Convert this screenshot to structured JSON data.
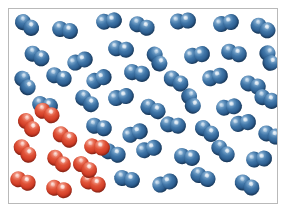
{
  "figure": {
    "width": 288,
    "height": 214
  },
  "frame": {
    "border_color": "#b9b9b9",
    "background_color": "#ffffff",
    "x": 8,
    "y": 8,
    "width": 270,
    "height": 196
  },
  "legend": {
    "blue_label": "blue diatomic molecule",
    "red_label": "red diatomic molecule",
    "blue_color": "#2c5d8f",
    "red_color": "#cf3a24"
  },
  "counts": {
    "blue": 43,
    "red": 10,
    "total": 53
  },
  "molecules": [
    {
      "color": "blue",
      "x": 26,
      "y": 24,
      "rot": 35
    },
    {
      "color": "blue",
      "x": 64,
      "y": 29,
      "rot": 12
    },
    {
      "color": "blue",
      "x": 108,
      "y": 20,
      "rot": -8
    },
    {
      "color": "blue",
      "x": 141,
      "y": 25,
      "rot": 20
    },
    {
      "color": "blue",
      "x": 182,
      "y": 20,
      "rot": -5
    },
    {
      "color": "blue",
      "x": 225,
      "y": 22,
      "rot": -12
    },
    {
      "color": "blue",
      "x": 262,
      "y": 27,
      "rot": 28
    },
    {
      "color": "blue",
      "x": 36,
      "y": 55,
      "rot": 28
    },
    {
      "color": "blue",
      "x": 79,
      "y": 60,
      "rot": -18
    },
    {
      "color": "blue",
      "x": 120,
      "y": 48,
      "rot": 8
    },
    {
      "color": "blue",
      "x": 156,
      "y": 58,
      "rot": 62
    },
    {
      "color": "blue",
      "x": 196,
      "y": 54,
      "rot": -10
    },
    {
      "color": "blue",
      "x": 233,
      "y": 52,
      "rot": 15
    },
    {
      "color": "blue",
      "x": 268,
      "y": 57,
      "rot": 72
    },
    {
      "color": "blue",
      "x": 24,
      "y": 82,
      "rot": 58
    },
    {
      "color": "blue",
      "x": 58,
      "y": 76,
      "rot": 20
    },
    {
      "color": "blue",
      "x": 98,
      "y": 78,
      "rot": -22
    },
    {
      "color": "blue",
      "x": 136,
      "y": 72,
      "rot": 10
    },
    {
      "color": "blue",
      "x": 175,
      "y": 80,
      "rot": 30
    },
    {
      "color": "blue",
      "x": 214,
      "y": 76,
      "rot": -15
    },
    {
      "color": "blue",
      "x": 252,
      "y": 84,
      "rot": 18
    },
    {
      "color": "blue",
      "x": 44,
      "y": 104,
      "rot": 12
    },
    {
      "color": "blue",
      "x": 86,
      "y": 100,
      "rot": 40
    },
    {
      "color": "blue",
      "x": 120,
      "y": 96,
      "rot": -12
    },
    {
      "color": "blue",
      "x": 152,
      "y": 108,
      "rot": 25
    },
    {
      "color": "blue",
      "x": 190,
      "y": 100,
      "rot": 68
    },
    {
      "color": "blue",
      "x": 228,
      "y": 106,
      "rot": -8
    },
    {
      "color": "blue",
      "x": 266,
      "y": 98,
      "rot": 22
    },
    {
      "color": "blue",
      "x": 98,
      "y": 126,
      "rot": 15
    },
    {
      "color": "blue",
      "x": 134,
      "y": 132,
      "rot": -20
    },
    {
      "color": "blue",
      "x": 172,
      "y": 124,
      "rot": 8
    },
    {
      "color": "blue",
      "x": 206,
      "y": 130,
      "rot": 35
    },
    {
      "color": "blue",
      "x": 242,
      "y": 122,
      "rot": -10
    },
    {
      "color": "blue",
      "x": 270,
      "y": 134,
      "rot": 18
    },
    {
      "color": "blue",
      "x": 112,
      "y": 152,
      "rot": 20
    },
    {
      "color": "blue",
      "x": 148,
      "y": 148,
      "rot": -14
    },
    {
      "color": "blue",
      "x": 186,
      "y": 156,
      "rot": 10
    },
    {
      "color": "blue",
      "x": 222,
      "y": 150,
      "rot": 42
    },
    {
      "color": "blue",
      "x": 258,
      "y": 158,
      "rot": -6
    },
    {
      "color": "blue",
      "x": 126,
      "y": 178,
      "rot": 12
    },
    {
      "color": "blue",
      "x": 164,
      "y": 182,
      "rot": -18
    },
    {
      "color": "blue",
      "x": 202,
      "y": 176,
      "rot": 24
    },
    {
      "color": "blue",
      "x": 246,
      "y": 184,
      "rot": 30
    },
    {
      "color": "red",
      "x": 28,
      "y": 124,
      "rot": 52
    },
    {
      "color": "red",
      "x": 64,
      "y": 136,
      "rot": 32
    },
    {
      "color": "red",
      "x": 24,
      "y": 150,
      "rot": 48
    },
    {
      "color": "red",
      "x": 58,
      "y": 160,
      "rot": 40
    },
    {
      "color": "red",
      "x": 96,
      "y": 146,
      "rot": 8
    },
    {
      "color": "red",
      "x": 22,
      "y": 180,
      "rot": 20
    },
    {
      "color": "red",
      "x": 58,
      "y": 188,
      "rot": 14
    },
    {
      "color": "red",
      "x": 92,
      "y": 182,
      "rot": 18
    },
    {
      "color": "red",
      "x": 46,
      "y": 112,
      "rot": 26
    },
    {
      "color": "red",
      "x": 84,
      "y": 166,
      "rot": 36
    }
  ]
}
